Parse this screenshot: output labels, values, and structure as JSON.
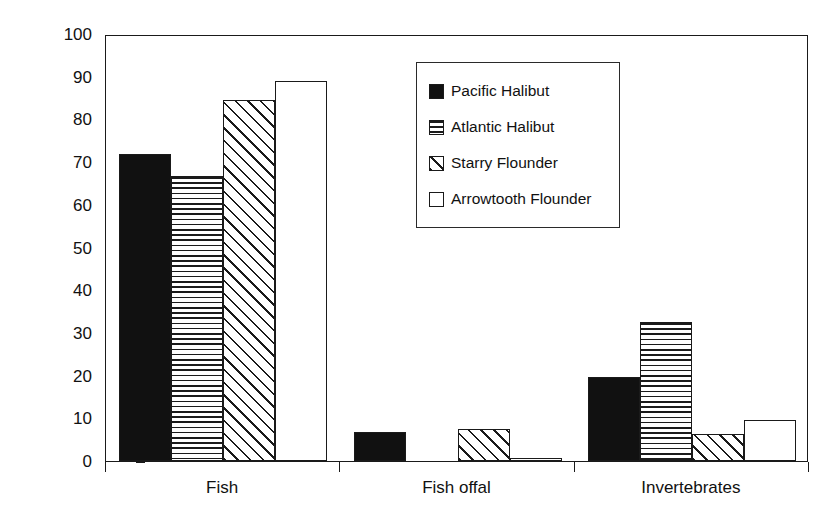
{
  "chart_data": {
    "type": "bar",
    "title": "",
    "xlabel": "",
    "ylabel": "% Diet Composition (by weight)",
    "categories": [
      "Fish",
      "Fish offal",
      "Invertebrates"
    ],
    "series": [
      {
        "name": "Pacific Halibut",
        "pattern": "solid",
        "values": [
          72.0,
          6.7,
          19.6
        ]
      },
      {
        "name": "Atlantic Halibut",
        "pattern": "hlines",
        "values": [
          66.7,
          0.0,
          32.6
        ]
      },
      {
        "name": "Starry Flounder",
        "pattern": "diag",
        "values": [
          84.6,
          7.5,
          6.4
        ]
      },
      {
        "name": "Arrowtooth Flounder",
        "pattern": "empty",
        "values": [
          89.0,
          0.7,
          9.5
        ]
      }
    ],
    "ylim": [
      0,
      100
    ],
    "ytick_step": 10,
    "yticks": [
      0,
      10,
      20,
      30,
      40,
      50,
      60,
      70,
      80,
      90,
      100
    ],
    "ytick_labels": [
      "0",
      "10",
      "20",
      "30",
      "40",
      "50",
      "60",
      "70",
      "80",
      "90",
      "100"
    ],
    "grid": false,
    "legend_position": "upper center"
  },
  "legend": {
    "entries": [
      {
        "label": "Pacific Halibut",
        "swatch": "solid-black-swatch"
      },
      {
        "label": "Atlantic Halibut",
        "swatch": "horizontal-lines-swatch"
      },
      {
        "label": "Starry Flounder",
        "swatch": "diagonal-hatch-swatch"
      },
      {
        "label": "Arrowtooth Flounder",
        "swatch": "empty-white-swatch"
      }
    ]
  }
}
